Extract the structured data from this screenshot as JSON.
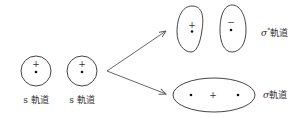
{
  "diagram": {
    "colors": {
      "stroke": "#444444",
      "text": "#333333",
      "background": "#ffffff"
    },
    "atomic_orbitals": [
      {
        "label": "s 軌道",
        "sign": "+"
      },
      {
        "label": "s 軌道",
        "sign": "+"
      }
    ],
    "molecular_orbitals": {
      "antibonding": {
        "label_symbol": "σ",
        "label_superscript": "*",
        "label_suffix": "軌道",
        "lobe_signs": [
          "+",
          "−"
        ]
      },
      "bonding": {
        "label_symbol": "σ",
        "label_suffix": "軌道",
        "sign": "+"
      }
    }
  }
}
